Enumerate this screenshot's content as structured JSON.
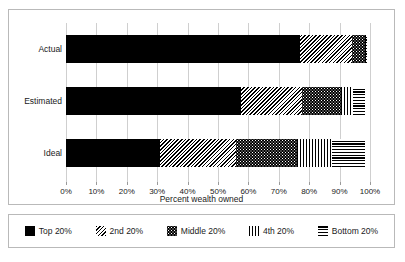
{
  "chart_data": {
    "type": "bar",
    "orientation": "horizontal",
    "stacked": true,
    "title": "",
    "xlabel": "Percent wealth owned",
    "ylabel": "",
    "xlim": [
      0,
      100
    ],
    "grid": true,
    "legend_position": "bottom",
    "categories": [
      "Actual",
      "Estimated",
      "Ideal"
    ],
    "xticks": [
      "0%",
      "10%",
      "20%",
      "30%",
      "40%",
      "50%",
      "60%",
      "70%",
      "80%",
      "90%",
      "100%"
    ],
    "xtick_values": [
      0,
      10,
      20,
      30,
      40,
      50,
      60,
      70,
      80,
      90,
      100
    ],
    "series": [
      {
        "name": "Top 20%",
        "pattern": "solid-black",
        "values": [
          77.0,
          57.5,
          31.0
        ]
      },
      {
        "name": "2nd 20%",
        "pattern": "diagonal-hatch",
        "values": [
          17.0,
          20.0,
          25.0
        ]
      },
      {
        "name": "Middle 20%",
        "pattern": "dotted-black",
        "values": [
          4.5,
          13.0,
          20.0
        ]
      },
      {
        "name": "4th 20%",
        "pattern": "vertical-lines",
        "values": [
          0.3,
          4.0,
          11.5
        ]
      },
      {
        "name": "Bottom 20%",
        "pattern": "horizontal-lines",
        "values": [
          0.2,
          4.0,
          11.0
        ]
      }
    ],
    "colors": {
      "ink": "#000000",
      "background": "#ffffff",
      "gridline": "#cfcfcf",
      "frame": "#b9b9b9",
      "text": "#1a1a1a"
    }
  },
  "axis": {
    "title": "Percent wealth owned"
  },
  "legend": {
    "items": [
      {
        "label": "Top 20%",
        "pattern": "solid-black"
      },
      {
        "label": "2nd 20%",
        "pattern": "diagonal-hatch"
      },
      {
        "label": "Middle 20%",
        "pattern": "dotted-black"
      },
      {
        "label": "4th 20%",
        "pattern": "vertical-lines"
      },
      {
        "label": "Bottom 20%",
        "pattern": "horizontal-lines"
      }
    ]
  }
}
